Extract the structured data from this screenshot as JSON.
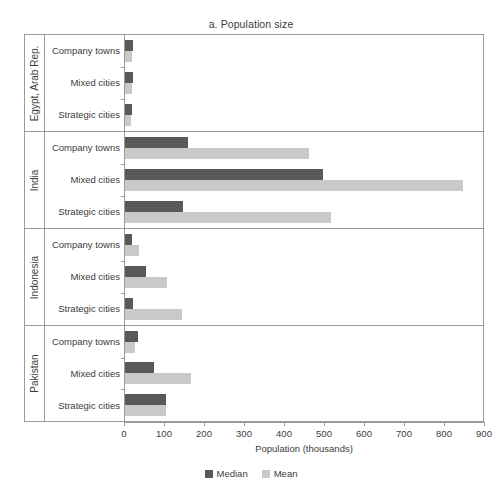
{
  "chart_data": {
    "type": "bar",
    "title": "a. Population size",
    "orientation": "horizontal",
    "xlabel": "Population (thousands)",
    "ylabel": "",
    "xlim": [
      0,
      900
    ],
    "xticks": [
      0,
      100,
      200,
      300,
      400,
      500,
      600,
      700,
      800,
      900
    ],
    "grid": false,
    "legend_position": "bottom-center",
    "series": [
      {
        "name": "Median",
        "color": "#595959"
      },
      {
        "name": "Mean",
        "color": "#c9c9c9"
      }
    ],
    "groups": [
      {
        "name": "Egypt, Arab Rep.",
        "categories": [
          {
            "label": "Company towns",
            "median": 19,
            "mean": 17
          },
          {
            "label": "Mixed cities",
            "median": 19,
            "mean": 18
          },
          {
            "label": "Strategic cities",
            "median": 18,
            "mean": 14
          }
        ]
      },
      {
        "name": "India",
        "categories": [
          {
            "label": "Company towns",
            "median": 157,
            "mean": 460
          },
          {
            "label": "Mixed cities",
            "median": 495,
            "mean": 845
          },
          {
            "label": "Strategic cities",
            "median": 145,
            "mean": 515
          }
        ]
      },
      {
        "name": "Indonesia",
        "categories": [
          {
            "label": "Company towns",
            "median": 17,
            "mean": 35
          },
          {
            "label": "Mixed cities",
            "median": 52,
            "mean": 105
          },
          {
            "label": "Strategic cities",
            "median": 20,
            "mean": 143
          }
        ]
      },
      {
        "name": "Pakistan",
        "categories": [
          {
            "label": "Company towns",
            "median": 33,
            "mean": 25
          },
          {
            "label": "Mixed cities",
            "median": 73,
            "mean": 165
          },
          {
            "label": "Strategic cities",
            "median": 102,
            "mean": 102
          }
        ]
      }
    ]
  },
  "colors": {
    "median": "#595959",
    "mean": "#c9c9c9",
    "axis": "#9a9a9a",
    "text": "#3c3c3c",
    "background": "#ffffff"
  }
}
